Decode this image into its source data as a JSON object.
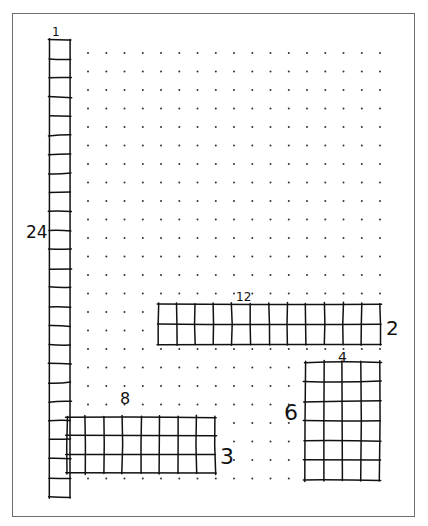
{
  "worksheet": {
    "dot_grid": {
      "cols": 17,
      "rows": 24,
      "x0": 88,
      "y0": 53,
      "dx": 18.25,
      "dy": 18.5,
      "dot_color": "#333333"
    },
    "rectangles": [
      {
        "id": "rect-1x24",
        "cols": 1,
        "rows": 24,
        "x": 50,
        "y": 40,
        "w": 20,
        "h": 457,
        "top_label": "1",
        "side_label": "24",
        "side": "left"
      },
      {
        "id": "rect-12x2",
        "cols": 12,
        "rows": 2,
        "x": 158,
        "y": 304,
        "w": 222,
        "h": 40,
        "top_label": "12",
        "side_label": "2",
        "side": "right"
      },
      {
        "id": "rect-8x3",
        "cols": 8,
        "rows": 3,
        "x": 67,
        "y": 417,
        "w": 148,
        "h": 56,
        "top_label": "8",
        "side_label": "3",
        "side": "right"
      },
      {
        "id": "rect-4x6",
        "cols": 4,
        "rows": 6,
        "x": 305,
        "y": 362,
        "w": 75,
        "h": 118,
        "top_label": "4",
        "side_label": "6",
        "side": "left"
      }
    ],
    "labels": {
      "l1": "1",
      "l24": "24",
      "l12": "12",
      "l2": "2",
      "l8": "8",
      "l3": "3",
      "l4": "4",
      "l6": "6"
    },
    "ink_color": "#111111",
    "frame_color": "#6e6e6e"
  }
}
